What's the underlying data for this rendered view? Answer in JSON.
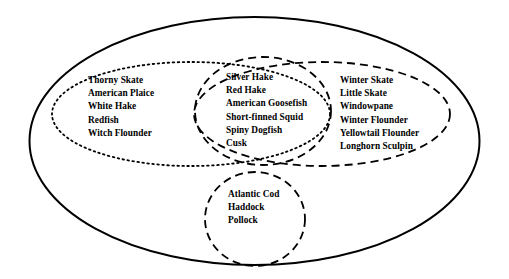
{
  "diagram": {
    "type": "venn-euler-diagram",
    "title": "",
    "shapes": {
      "outer_boundary": {
        "name": "outer-ellipse",
        "style": "solid",
        "color": "#000000",
        "stroke_width": 2.0,
        "cx": 254.5,
        "cy": 141,
        "rx": 225,
        "ry": 124
      },
      "left_set": {
        "name": "left-ellipse",
        "style": "dotted",
        "color": "#000000",
        "stroke_width": 1.8,
        "cx": 191,
        "cy": 114,
        "rx": 139,
        "ry": 52
      },
      "right_set": {
        "name": "right-ellipse",
        "style": "dashed",
        "color": "#000000",
        "stroke_width": 1.8,
        "cx": 322,
        "cy": 114,
        "rx": 128,
        "ry": 52
      },
      "center_set": {
        "name": "center-ellipse",
        "style": "dashed",
        "color": "#000000",
        "stroke_width": 1.8,
        "cx": 263,
        "cy": 111,
        "rx": 68,
        "ry": 54
      },
      "bottom_set": {
        "name": "bottom-circle",
        "style": "dashed",
        "color": "#000000",
        "stroke_width": 1.8,
        "cx": 255,
        "cy": 219,
        "rx": 50,
        "ry": 47
      }
    },
    "groups": {
      "left": {
        "label": "left-species-group",
        "species": [
          "Thorny Skate",
          "American Plaice",
          "White Hake",
          "Redfish",
          "Witch Flounder"
        ]
      },
      "center": {
        "label": "center-species-group",
        "species": [
          "Silver Hake",
          "Red Hake",
          "American Goosefish",
          "Short-finned Squid",
          "Spiny Dogfish",
          "Cusk"
        ]
      },
      "right": {
        "label": "right-species-group",
        "species": [
          "Winter Skate",
          "Little Skate",
          "Windowpane",
          "Winter Flounder",
          "Yellowtail Flounder",
          "Longhorn Sculpin"
        ]
      },
      "bottom": {
        "label": "bottom-species-group",
        "species": [
          "Atlantic Cod",
          "Haddock",
          "Pollock"
        ]
      }
    }
  }
}
